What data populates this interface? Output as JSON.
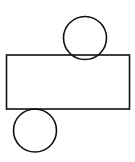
{
  "diagram": {
    "stroke_color": "#111111",
    "background": "#ffffff",
    "shapes": {
      "top_circle": {
        "cx": 85,
        "cy": 38,
        "r": 21.5
      },
      "rectangle": {
        "x": 6.5,
        "y": 55,
        "width": 123,
        "height": 54
      },
      "bottom_circle": {
        "cx": 35,
        "cy": 130.5,
        "r": 21.5
      }
    }
  }
}
